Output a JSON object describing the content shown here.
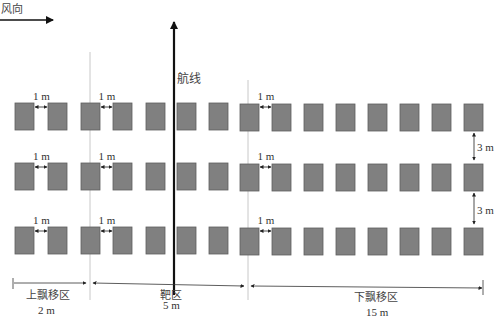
{
  "wind": {
    "label": "风向"
  },
  "flight_line": {
    "label": "航线"
  },
  "gap_label": "1 m",
  "row_gap_label": "3 m",
  "zones": [
    {
      "name": "上飘移区",
      "distance": "2 m"
    },
    {
      "name": "靶区",
      "distance": "5 m"
    },
    {
      "name": "下飘移区",
      "distance": "15 m"
    }
  ],
  "layout": {
    "rows": 3,
    "plots_per_row": 15,
    "plot_color": "#808080",
    "plot_border": "#5e5e5e"
  }
}
